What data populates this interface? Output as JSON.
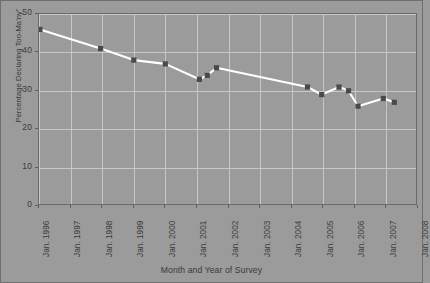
{
  "figure": {
    "background_color": "#9b9b9b",
    "frame_color": "#6a6a6a",
    "grid_color": "#cfcfcf",
    "line_color": "#ffffff",
    "marker_color": "#4a4a4a"
  },
  "chart_data": {
    "type": "line",
    "title": "",
    "xlabel": "Month and Year of Survey",
    "ylabel": "Percentage Declaring Too-Ma'ny\"",
    "ylim": [
      0,
      50
    ],
    "yticks": [
      0,
      10,
      20,
      30,
      40,
      50
    ],
    "ytick_labels": [
      "0",
      "10",
      "20",
      "30",
      "40",
      "50"
    ],
    "xlim": [
      "Jan. 1996",
      "Jan. 2008"
    ],
    "xtick_labels": [
      "Jan. 1996",
      "Jan. 1997",
      "Jan. 1998",
      "Jan. 1999",
      "Jan. 2000",
      "Jan. 2001",
      "Jan. 2002",
      "Jan. 2003",
      "Jan. 2004",
      "Jan. 2005",
      "Jan. 2006",
      "Jan. 2007",
      "Jan. 2008"
    ],
    "grid": true,
    "legend": false,
    "marker": "square",
    "x": [
      1996.03,
      1997.95,
      1999.0,
      2000.0,
      2001.08,
      2001.33,
      2001.62,
      2004.5,
      2004.95,
      2005.5,
      2005.8,
      2006.1,
      2006.9,
      2007.25
    ],
    "values": [
      46,
      41,
      38,
      37,
      33,
      34,
      36,
      31,
      29,
      31,
      30,
      26,
      28,
      27
    ],
    "points": [
      {
        "label": "Jan. 1996",
        "x": 1996.03,
        "y": 46
      },
      {
        "label": "Dec. 1997",
        "x": 1997.95,
        "y": 41
      },
      {
        "label": "Jan. 1999",
        "x": 1999.0,
        "y": 38
      },
      {
        "label": "Jan. 2000",
        "x": 2000.0,
        "y": 37
      },
      {
        "label": "Feb. 2001",
        "x": 2001.08,
        "y": 33
      },
      {
        "label": "May 2001",
        "x": 2001.33,
        "y": 34
      },
      {
        "label": "Aug. 2001",
        "x": 2001.62,
        "y": 36
      },
      {
        "label": "Jul. 2004",
        "x": 2004.5,
        "y": 31
      },
      {
        "label": "Dec. 2004",
        "x": 2004.95,
        "y": 29
      },
      {
        "label": "Jul. 2005",
        "x": 2005.5,
        "y": 31
      },
      {
        "label": "Oct. 2005",
        "x": 2005.8,
        "y": 30
      },
      {
        "label": "Feb. 2006",
        "x": 2006.1,
        "y": 26
      },
      {
        "label": "Nov. 2006",
        "x": 2006.9,
        "y": 28
      },
      {
        "label": "Apr. 2007",
        "x": 2007.25,
        "y": 27
      }
    ]
  }
}
